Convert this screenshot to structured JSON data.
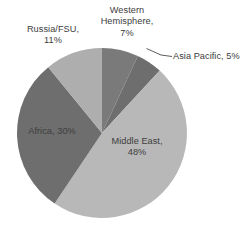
{
  "chart_data": {
    "type": "pie",
    "title": "",
    "categories": [
      "Western Hemisphere",
      "Asia Pacific",
      "Middle East",
      "Africa",
      "Russia/FSU"
    ],
    "values": [
      7,
      5,
      48,
      30,
      11
    ],
    "unit": "%",
    "start_angle_deg": 0,
    "direction": "clockwise",
    "legend": "none",
    "grid": false,
    "labels": [
      {
        "name": "western-hemisphere",
        "text": "Western\nHemisphere,\n7%",
        "category": "Western Hemisphere",
        "value": 7,
        "percent_text": "7%",
        "placement": "outside-top",
        "color": "#7a7a7a"
      },
      {
        "name": "asia-pacific",
        "text": "Asia Pacific, 5%",
        "category": "Asia Pacific",
        "value": 5,
        "percent_text": "5%",
        "placement": "outside-right-leader",
        "color": "#6e6e6e"
      },
      {
        "name": "middle-east",
        "text": "Middle East,\n48%",
        "category": "Middle East",
        "value": 48,
        "percent_text": "48%",
        "placement": "inside",
        "color": "#b8b8b8"
      },
      {
        "name": "africa",
        "text": "Africa, 30%",
        "category": "Africa",
        "value": 30,
        "percent_text": "30%",
        "placement": "inside",
        "color": "#6e6e6e"
      },
      {
        "name": "russia-fsu",
        "text": "Russia/FSU,\n11%",
        "category": "Russia/FSU",
        "value": 11,
        "percent_text": "11%",
        "placement": "outside-top-left",
        "color": "#aeaeae"
      }
    ],
    "colors": {
      "western_hemisphere": "#7a7a7a",
      "asia_pacific": "#6e6e6e",
      "middle_east": "#b8b8b8",
      "africa": "#6e6e6e",
      "russia_fsu": "#aeaeae",
      "background": "#ffffff",
      "text": "#3d3d3d",
      "leader_line": "#4a4a4a"
    }
  }
}
